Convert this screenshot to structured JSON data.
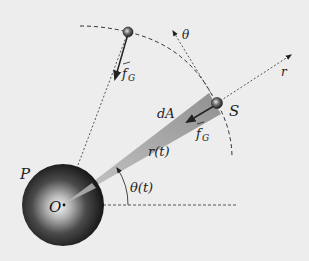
{
  "diagram": {
    "colors": {
      "background": "#ededed",
      "line": "#333333",
      "wedge": "#9a9a9a",
      "planet_dark": "#1a1a1a",
      "planet_light": "#f2f2f2"
    },
    "labels": {
      "planet": "P",
      "origin": "O",
      "satellite": "S",
      "area": "dA",
      "radius": "r(t)",
      "angle": "θ(t)",
      "theta_axis": "θ",
      "r_axis": "r",
      "force_top": "f",
      "force_top_sub": "G",
      "force_s": "f",
      "force_s_sub": "G"
    },
    "nodes": [
      {
        "id": "planet",
        "label": "P",
        "cx": 63,
        "cy": 205,
        "r": 41
      },
      {
        "id": "satellite-top",
        "cx": 128,
        "cy": 32,
        "r": 5
      },
      {
        "id": "satellite-s",
        "label": "S",
        "cx": 217,
        "cy": 103,
        "r": 5
      }
    ],
    "edges": [
      {
        "from": "satellite-top",
        "to": "planet",
        "style": "dotted",
        "label": ""
      },
      {
        "from": "planet",
        "to": "satellite-s",
        "style": "wedge",
        "label": "r(t)"
      },
      {
        "from": "satellite-s",
        "to": "r-direction",
        "style": "dotted-arrow",
        "label": "r"
      },
      {
        "from": "satellite-s",
        "to": "theta-direction",
        "style": "dotted-arrow",
        "label": "θ"
      },
      {
        "from": "satellite-top",
        "to": "planet",
        "style": "force-arrow",
        "label": "f_G"
      },
      {
        "from": "satellite-s",
        "to": "planet",
        "style": "force-arrow",
        "label": "f_G"
      }
    ]
  }
}
